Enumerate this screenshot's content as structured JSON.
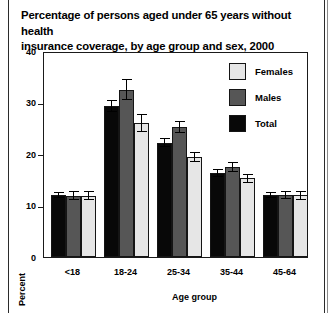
{
  "chart_data": {
    "type": "bar",
    "title": "Percentage of persons aged under 65 years without health insurance coverage, by age group and sex, 2000",
    "title_line1": "Percentage of persons aged under 65 years without health",
    "title_line2": "insurance coverage, by age group and sex, 2000",
    "xlabel": "Age group",
    "ylabel": "Percent",
    "ylim": [
      0,
      40
    ],
    "yticks": [
      0,
      10,
      20,
      30,
      40
    ],
    "ytick_labels": [
      "0",
      "10",
      "20",
      "30",
      "40"
    ],
    "grid": false,
    "legend_position": "top-right-inside",
    "categories": [
      "<18",
      "18-24",
      "25-34",
      "35-44",
      "45-64"
    ],
    "series": [
      {
        "name": "Total",
        "color": "#080808",
        "values": [
          12.0,
          29.3,
          22.2,
          16.3,
          12.1
        ],
        "errors": [
          0.6,
          1.2,
          0.9,
          0.7,
          0.6
        ]
      },
      {
        "name": "Males",
        "color": "#565656",
        "values": [
          11.9,
          32.5,
          25.2,
          17.5,
          12.1
        ],
        "errors": [
          0.9,
          2.1,
          1.2,
          0.9,
          0.8
        ]
      },
      {
        "name": "Females",
        "color": "#e6e6e6",
        "values": [
          11.9,
          26.0,
          19.4,
          15.3,
          12.0
        ],
        "errors": [
          0.9,
          1.8,
          0.9,
          0.9,
          0.9
        ]
      }
    ],
    "legend": [
      {
        "label": "Females",
        "color": "#e6e6e6"
      },
      {
        "label": "Males",
        "color": "#565656"
      },
      {
        "label": "Total",
        "color": "#080808"
      }
    ]
  }
}
